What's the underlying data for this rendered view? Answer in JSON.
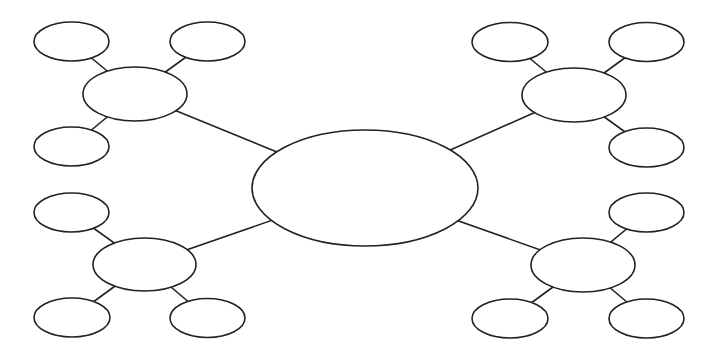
{
  "diagram": {
    "type": "mind-map",
    "colors": {
      "stroke": "#222222",
      "fill": "#ffffff",
      "background": "#ffffff"
    },
    "center": {
      "cx": 365,
      "cy": 188,
      "rx": 113,
      "ry": 58,
      "label": ""
    },
    "branches": [
      {
        "name": "top-left",
        "node": {
          "cx": 135,
          "cy": 94,
          "rx": 52,
          "ry": 27,
          "label": ""
        },
        "leaves": [
          {
            "cx": 71.5,
            "cy": 41.5,
            "rx": 37.5,
            "ry": 19.5,
            "label": ""
          },
          {
            "cx": 207.5,
            "cy": 41.5,
            "rx": 37.5,
            "ry": 19.5,
            "label": ""
          },
          {
            "cx": 71.5,
            "cy": 146.5,
            "rx": 37.5,
            "ry": 19.5,
            "label": ""
          }
        ]
      },
      {
        "name": "top-right",
        "node": {
          "cx": 574,
          "cy": 95,
          "rx": 52,
          "ry": 27,
          "label": ""
        },
        "leaves": [
          {
            "cx": 510,
            "cy": 42,
            "rx": 38,
            "ry": 19.5,
            "label": ""
          },
          {
            "cx": 646.5,
            "cy": 42,
            "rx": 37.5,
            "ry": 19.5,
            "label": ""
          },
          {
            "cx": 646.5,
            "cy": 147.5,
            "rx": 37.5,
            "ry": 19.5,
            "label": ""
          }
        ]
      },
      {
        "name": "bottom-left",
        "node": {
          "cx": 144.5,
          "cy": 264.5,
          "rx": 51.5,
          "ry": 26.5,
          "label": ""
        },
        "leaves": [
          {
            "cx": 71.5,
            "cy": 212.5,
            "rx": 37.5,
            "ry": 19.5,
            "label": ""
          },
          {
            "cx": 72,
            "cy": 317.5,
            "rx": 38,
            "ry": 19.5,
            "label": ""
          },
          {
            "cx": 207.5,
            "cy": 318,
            "rx": 37.5,
            "ry": 19.5,
            "label": ""
          }
        ]
      },
      {
        "name": "bottom-right",
        "node": {
          "cx": 583,
          "cy": 265,
          "rx": 52,
          "ry": 27,
          "label": ""
        },
        "leaves": [
          {
            "cx": 646.5,
            "cy": 212.5,
            "rx": 37.5,
            "ry": 19.5,
            "label": ""
          },
          {
            "cx": 510,
            "cy": 318.5,
            "rx": 38,
            "ry": 19.5,
            "label": ""
          },
          {
            "cx": 646.5,
            "cy": 318.5,
            "rx": 37.5,
            "ry": 19.5,
            "label": ""
          }
        ]
      }
    ]
  }
}
